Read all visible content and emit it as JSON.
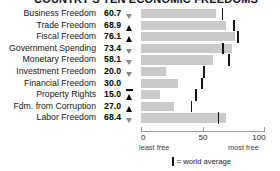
{
  "title": "COUNTRY'S TEN ECONOMIC FREEDOMS",
  "chart_data": {
    "type": "bar",
    "title": "COUNTRY'S TEN ECONOMIC FREEDOMS",
    "xlabel": "",
    "ylabel": "",
    "xlim": [
      0,
      100
    ],
    "grid": false,
    "orientation": "horizontal",
    "categories": [
      "Business Freedom",
      "Trade Freedom",
      "Fiscal Freedom",
      "Government Spending",
      "Monetary Freedom",
      "Investment Freedom",
      "Financial Freedom",
      "Property Rights",
      "Fdm. from Corruption",
      "Labor Freedom"
    ],
    "values": [
      60.7,
      68.9,
      76.1,
      73.4,
      58.1,
      20.0,
      30.0,
      15.0,
      27.0,
      68.4
    ],
    "value_labels": [
      "60.7",
      "68.9",
      "76.1",
      "73.4",
      "58.1",
      "20.0",
      "30.0",
      "15.0",
      "27.0",
      "68.4"
    ],
    "trend_markers": [
      "down",
      "up",
      "up",
      "down",
      "down",
      "down",
      "flat",
      "up",
      "up",
      "down"
    ],
    "world_average": [
      65.0,
      74.5,
      77.5,
      65.5,
      70.5,
      50.0,
      48.5,
      43.5,
      40.0,
      62.0
    ],
    "series": [
      {
        "name": "Country score",
        "values": [
          60.7,
          68.9,
          76.1,
          73.4,
          58.1,
          20.0,
          30.0,
          15.0,
          27.0,
          68.4
        ]
      },
      {
        "name": "World average",
        "values": [
          65.0,
          74.5,
          77.5,
          65.5,
          70.5,
          50.0,
          48.5,
          43.5,
          40.0,
          62.0
        ]
      }
    ],
    "axis_ticks": [
      "0",
      "50",
      "100"
    ],
    "axis_tick_values": [
      0,
      50,
      100
    ],
    "axis_note_left": "least free",
    "axis_note_right": "most free",
    "legend": {
      "position": "bottom",
      "entries": [
        "= world average"
      ]
    },
    "colors": {
      "bar": "#c9c9c9",
      "average_tick": "#141414",
      "marker_up": "#000000",
      "marker_down": "#8a8a8a"
    }
  },
  "axis": {
    "tick_0": "0",
    "tick_50": "50",
    "tick_100": "100",
    "least_free": "least free",
    "most_free": "most free"
  },
  "legend": {
    "label": "= world average"
  },
  "rows": [
    {
      "label": "Business Freedom",
      "value": "60.7",
      "marker": "down"
    },
    {
      "label": "Trade Freedom",
      "value": "68.9",
      "marker": "up"
    },
    {
      "label": "Fiscal Freedom",
      "value": "76.1",
      "marker": "up"
    },
    {
      "label": "Government Spending",
      "value": "73.4",
      "marker": "down"
    },
    {
      "label": "Monetary Freedom",
      "value": "58.1",
      "marker": "down"
    },
    {
      "label": "Investment Freedom",
      "value": "20.0",
      "marker": "down"
    },
    {
      "label": "Financial Freedom",
      "value": "30.0",
      "marker": "flat"
    },
    {
      "label": "Property Rights",
      "value": "15.0",
      "marker": "up"
    },
    {
      "label": "Fdm. from Corruption",
      "value": "27.0",
      "marker": "up"
    },
    {
      "label": "Labor Freedom",
      "value": "68.4",
      "marker": "down"
    }
  ]
}
